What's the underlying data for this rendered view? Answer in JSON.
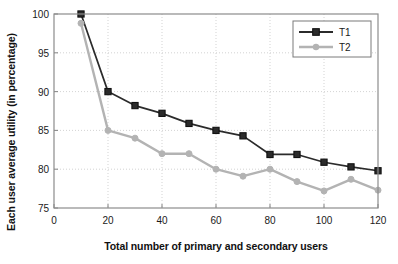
{
  "chart_data": {
    "type": "line",
    "title": "",
    "xlabel": "Total number of primary and secondary users",
    "ylabel": "Each user average utility (in percentage)",
    "x": [
      10,
      20,
      30,
      40,
      50,
      60,
      70,
      80,
      90,
      100,
      110,
      120
    ],
    "xlim": [
      0,
      120
    ],
    "ylim": [
      75,
      100
    ],
    "xticks": [
      0,
      20,
      40,
      60,
      80,
      100,
      120
    ],
    "yticks": [
      75,
      80,
      85,
      90,
      95,
      100
    ],
    "xtick_labels": [
      "0",
      "20",
      "40",
      "60",
      "80",
      "100",
      "120"
    ],
    "ytick_labels": [
      "75",
      "80",
      "85",
      "90",
      "95",
      "100"
    ],
    "grid": true,
    "legend_position": "upper right",
    "series": [
      {
        "name": "T1",
        "color": "#2b2b2b",
        "marker": "square",
        "values": [
          100.0,
          90.0,
          88.2,
          87.2,
          85.9,
          85.0,
          84.3,
          81.9,
          81.9,
          80.9,
          80.3,
          79.8
        ]
      },
      {
        "name": "T2",
        "color": "#b3b3b3",
        "marker": "circle",
        "values": [
          98.8,
          85.0,
          84.0,
          82.0,
          82.0,
          80.0,
          79.1,
          80.0,
          78.4,
          77.2,
          78.7,
          77.3
        ]
      }
    ]
  },
  "axes": {
    "frame_color": "#8c8c8c",
    "grid_color": "#c8c8c8"
  }
}
